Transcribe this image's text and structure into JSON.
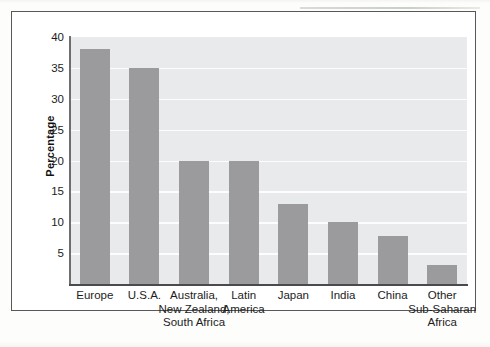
{
  "chart_data": {
    "type": "bar",
    "title": "",
    "subtitle": "",
    "xlabel": "",
    "ylabel": "Percentage",
    "ylim": [
      0,
      40
    ],
    "ytick_labels": [
      "5",
      "10",
      "15",
      "20",
      "25",
      "30",
      "35",
      "40"
    ],
    "ytick_values": [
      5,
      10,
      15,
      20,
      25,
      30,
      35,
      40
    ],
    "grid": true,
    "legend": "none",
    "categories": [
      "Europe",
      "U.S.A.",
      "Australia, New Zealand, South Africa",
      "Latin America",
      "Japan",
      "India",
      "China",
      "Other Sub-Saharan Africa"
    ],
    "category_lines": [
      [
        "Europe"
      ],
      [
        "U.S.A."
      ],
      [
        "Australia,",
        "New Zealand,",
        "South Africa"
      ],
      [
        "Latin",
        "America"
      ],
      [
        "Japan"
      ],
      [
        "India"
      ],
      [
        "China"
      ],
      [
        "Other",
        "Sub-Saharan",
        "Africa"
      ]
    ],
    "values": [
      38,
      35,
      20,
      20,
      13,
      10,
      7.8,
      3
    ],
    "bar_color": "#9b9b9d",
    "plot_background": "#e9eaec",
    "gridline_color": "#fdfdfd",
    "axis_color": "#4a4a4c"
  }
}
